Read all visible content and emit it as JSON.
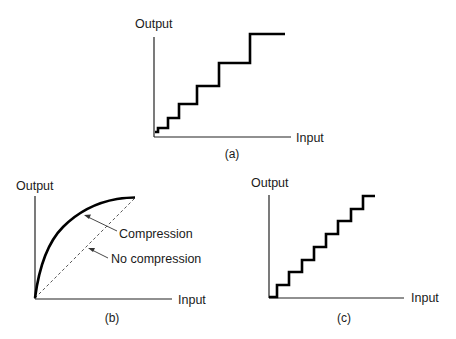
{
  "panels": {
    "a": {
      "caption": "(a)",
      "y_label": "Output",
      "x_label": "Input",
      "description": "Quantization staircase with step sizes increasing with input (nonuniform / companded)"
    },
    "b": {
      "caption": "(b)",
      "y_label": "Output",
      "x_label": "Input",
      "annotations": {
        "compression": "Compression",
        "no_compression": "No compression"
      }
    },
    "c": {
      "caption": "(c)",
      "y_label": "Output",
      "x_label": "Input",
      "description": "Uniform quantization staircase with equal steps"
    }
  },
  "colors": {
    "ink": "#000000",
    "background": "#ffffff"
  }
}
